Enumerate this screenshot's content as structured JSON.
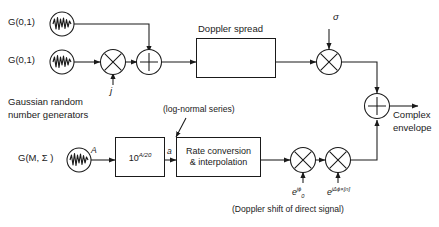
{
  "diagram": {
    "labels": {
      "gauss_top": "G(0,1)",
      "gauss_mid": "G(0,1)",
      "gauss_caption_line1": "Gaussian random",
      "gauss_caption_line2": "number generators",
      "j_label": "j",
      "doppler_spread": "Doppler spread",
      "fmax": "f",
      "fmax_sub": "max",
      "sigma": "σ",
      "lognormal_note": "(log-normal series)",
      "gauss_lognormal": "G(M, Σ )",
      "amp_A": "A",
      "pow_block_base": "10",
      "pow_block_exp": "A/20",
      "amp_a": "a",
      "rate_line1": "Rate conversion",
      "rate_line2": "& interpolation",
      "exp_phi0_base": "e",
      "exp_phi0_exp": "jϕ",
      "exp_phi0_sub": "0",
      "exp_dphi_base": "e",
      "exp_dphi_exp": "jΔϕ×[n]",
      "doppler_shift_caption": "(Doppler shift of direct signal)",
      "complex_line1": "Complex",
      "complex_line2": "envelope"
    },
    "operators": {
      "multiplier_glyph": "⊗",
      "adder_glyph": "⊕"
    },
    "colors": {
      "line": "#1a1a1a",
      "background": "#ffffff",
      "shadow": "#b9b9b9",
      "text": "#1a1a1a"
    }
  }
}
